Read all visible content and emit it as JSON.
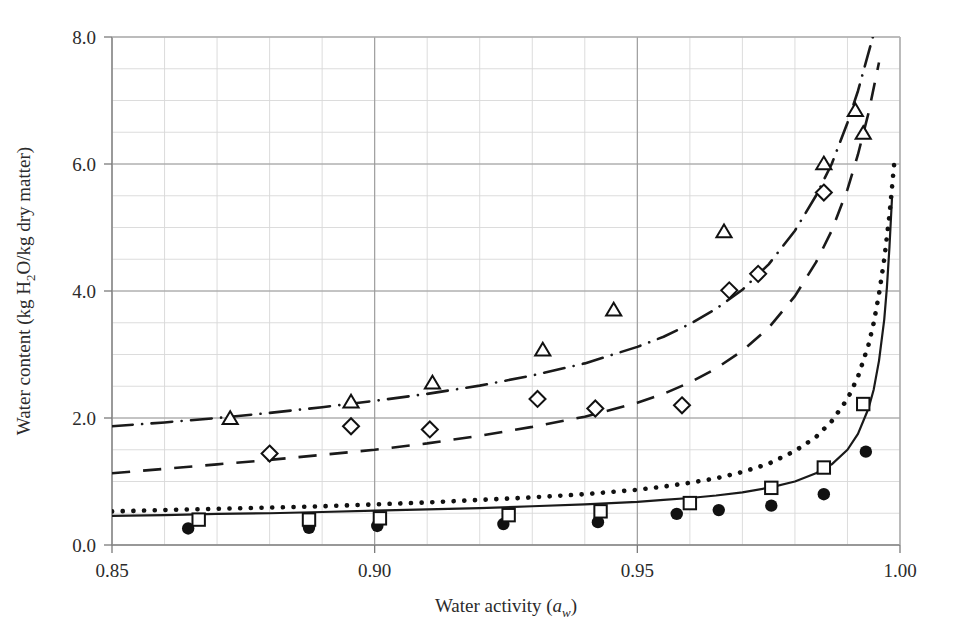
{
  "chart_data": {
    "type": "scatter",
    "title": "",
    "xlabel": "Water activity (a_w)",
    "xlabel_main": "Water activity (",
    "xlabel_sym": "a",
    "xlabel_sub": "w",
    "xlabel_close": ")",
    "ylabel": "Water content (kg H2O/kg dry matter)",
    "ylabel_p1": "Water content (kg H",
    "ylabel_sub": "2",
    "ylabel_p2": "O/kg dry matter)",
    "xlim": [
      0.85,
      1.0
    ],
    "ylim": [
      0.0,
      8.0
    ],
    "xticks": [
      0.85,
      0.9,
      0.95,
      1.0
    ],
    "xtick_labels": [
      "0.85",
      "0.90",
      "0.95",
      "1.00"
    ],
    "yticks": [
      0.0,
      2.0,
      4.0,
      6.0,
      8.0
    ],
    "ytick_labels": [
      "0.0",
      "2.0",
      "4.0",
      "6.0",
      "8.0"
    ],
    "x_minor_step": 0.01,
    "y_minor_step": 0.5,
    "grid": true,
    "grid_major_color": "#9a9a9a",
    "grid_minor_color": "#d8d8d8",
    "legend": "none",
    "series": [
      {
        "name": "filled-circle-data",
        "marker": "filled-circle",
        "linestyle": "none",
        "color": "#111111",
        "points": [
          [
            0.8645,
            0.26
          ],
          [
            0.8875,
            0.27
          ],
          [
            0.9005,
            0.3
          ],
          [
            0.9245,
            0.33
          ],
          [
            0.9425,
            0.36
          ],
          [
            0.9575,
            0.49
          ],
          [
            0.9655,
            0.55
          ],
          [
            0.9755,
            0.62
          ],
          [
            0.9855,
            0.8
          ],
          [
            0.9935,
            1.47
          ]
        ]
      },
      {
        "name": "open-square-data",
        "marker": "open-square",
        "linestyle": "none",
        "color": "#111111",
        "points": [
          [
            0.8665,
            0.4
          ],
          [
            0.8875,
            0.4
          ],
          [
            0.901,
            0.42
          ],
          [
            0.9255,
            0.47
          ],
          [
            0.943,
            0.53
          ],
          [
            0.96,
            0.66
          ],
          [
            0.9755,
            0.9
          ],
          [
            0.9855,
            1.22
          ],
          [
            0.993,
            2.22
          ]
        ]
      },
      {
        "name": "open-diamond-data",
        "marker": "open-diamond",
        "linestyle": "none",
        "color": "#111111",
        "points": [
          [
            0.88,
            1.44
          ],
          [
            0.8955,
            1.87
          ],
          [
            0.9105,
            1.82
          ],
          [
            0.931,
            2.3
          ],
          [
            0.942,
            2.15
          ],
          [
            0.9585,
            2.2
          ],
          [
            0.9675,
            4.01
          ],
          [
            0.973,
            4.27
          ],
          [
            0.9855,
            5.55
          ]
        ]
      },
      {
        "name": "open-triangle-data",
        "marker": "open-triangle",
        "linestyle": "none",
        "color": "#111111",
        "points": [
          [
            0.8725,
            1.99
          ],
          [
            0.8955,
            2.25
          ],
          [
            0.911,
            2.55
          ],
          [
            0.932,
            3.07
          ],
          [
            0.9455,
            3.7
          ],
          [
            0.9665,
            4.93
          ],
          [
            0.9855,
            6.0
          ],
          [
            0.9915,
            6.84
          ],
          [
            0.993,
            6.48
          ]
        ]
      }
    ],
    "curves": [
      {
        "name": "solid-model-curve",
        "style": "solid",
        "color": "#1a1a1a",
        "width": 2.2,
        "points": [
          [
            0.85,
            0.46
          ],
          [
            0.86,
            0.47
          ],
          [
            0.87,
            0.49
          ],
          [
            0.88,
            0.5
          ],
          [
            0.89,
            0.52
          ],
          [
            0.9,
            0.54
          ],
          [
            0.91,
            0.56
          ],
          [
            0.92,
            0.58
          ],
          [
            0.93,
            0.61
          ],
          [
            0.94,
            0.64
          ],
          [
            0.95,
            0.68
          ],
          [
            0.955,
            0.71
          ],
          [
            0.96,
            0.74
          ],
          [
            0.965,
            0.78
          ],
          [
            0.97,
            0.83
          ],
          [
            0.975,
            0.9
          ],
          [
            0.98,
            1.0
          ],
          [
            0.984,
            1.13
          ],
          [
            0.987,
            1.27
          ],
          [
            0.99,
            1.5
          ],
          [
            0.992,
            1.75
          ],
          [
            0.994,
            2.15
          ],
          [
            0.995,
            2.45
          ],
          [
            0.996,
            2.9
          ],
          [
            0.997,
            3.55
          ],
          [
            0.9975,
            4.05
          ],
          [
            0.998,
            4.7
          ],
          [
            0.9985,
            5.5
          ]
        ]
      },
      {
        "name": "dotted-model-curve",
        "style": "dotted",
        "color": "#111111",
        "width": 4.6,
        "points": [
          [
            0.85,
            0.53
          ],
          [
            0.86,
            0.55
          ],
          [
            0.87,
            0.57
          ],
          [
            0.88,
            0.59
          ],
          [
            0.89,
            0.61
          ],
          [
            0.9,
            0.64
          ],
          [
            0.91,
            0.67
          ],
          [
            0.92,
            0.71
          ],
          [
            0.93,
            0.75
          ],
          [
            0.94,
            0.8
          ],
          [
            0.95,
            0.87
          ],
          [
            0.955,
            0.92
          ],
          [
            0.96,
            0.98
          ],
          [
            0.965,
            1.05
          ],
          [
            0.97,
            1.15
          ],
          [
            0.975,
            1.28
          ],
          [
            0.98,
            1.48
          ],
          [
            0.984,
            1.7
          ],
          [
            0.987,
            1.95
          ],
          [
            0.99,
            2.3
          ],
          [
            0.992,
            2.65
          ],
          [
            0.994,
            3.15
          ],
          [
            0.995,
            3.5
          ],
          [
            0.996,
            3.95
          ],
          [
            0.997,
            4.5
          ],
          [
            0.998,
            5.2
          ],
          [
            0.999,
            6.1
          ]
        ]
      },
      {
        "name": "dashed-diamond-curve",
        "style": "dashed",
        "color": "#1a1a1a",
        "width": 2.6,
        "points": [
          [
            0.85,
            1.13
          ],
          [
            0.86,
            1.2
          ],
          [
            0.87,
            1.27
          ],
          [
            0.88,
            1.34
          ],
          [
            0.89,
            1.42
          ],
          [
            0.9,
            1.5
          ],
          [
            0.91,
            1.6
          ],
          [
            0.92,
            1.72
          ],
          [
            0.93,
            1.86
          ],
          [
            0.94,
            2.02
          ],
          [
            0.95,
            2.24
          ],
          [
            0.955,
            2.38
          ],
          [
            0.96,
            2.56
          ],
          [
            0.965,
            2.78
          ],
          [
            0.97,
            3.06
          ],
          [
            0.975,
            3.42
          ],
          [
            0.98,
            3.92
          ],
          [
            0.984,
            4.45
          ],
          [
            0.987,
            4.95
          ],
          [
            0.99,
            5.6
          ],
          [
            0.992,
            6.15
          ],
          [
            0.994,
            6.8
          ],
          [
            0.996,
            7.6
          ]
        ]
      },
      {
        "name": "dash-dot-triangle-curve",
        "style": "dashdot",
        "color": "#1a1a1a",
        "width": 2.6,
        "points": [
          [
            0.85,
            1.87
          ],
          [
            0.86,
            1.93
          ],
          [
            0.87,
            2.0
          ],
          [
            0.88,
            2.08
          ],
          [
            0.89,
            2.17
          ],
          [
            0.9,
            2.27
          ],
          [
            0.91,
            2.38
          ],
          [
            0.92,
            2.51
          ],
          [
            0.93,
            2.67
          ],
          [
            0.94,
            2.86
          ],
          [
            0.95,
            3.12
          ],
          [
            0.955,
            3.28
          ],
          [
            0.96,
            3.48
          ],
          [
            0.965,
            3.72
          ],
          [
            0.97,
            4.02
          ],
          [
            0.975,
            4.42
          ],
          [
            0.98,
            4.95
          ],
          [
            0.984,
            5.5
          ],
          [
            0.987,
            6.0
          ],
          [
            0.99,
            6.65
          ],
          [
            0.992,
            7.15
          ],
          [
            0.994,
            7.75
          ],
          [
            0.9955,
            8.2
          ]
        ]
      }
    ]
  },
  "plot_geometry": {
    "left": 112,
    "right": 900,
    "top": 37,
    "bottom": 545
  }
}
